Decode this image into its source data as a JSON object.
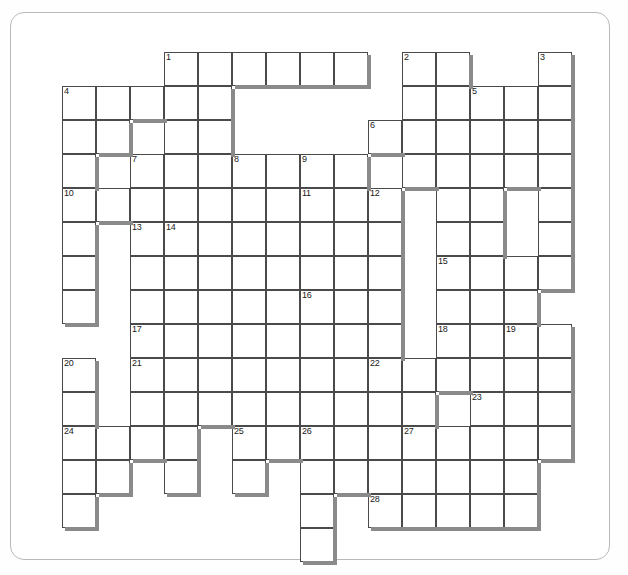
{
  "document": {
    "type": "crossword-puzzle-grid",
    "title": "Crossword Puzzle Grid",
    "sheet_background": "#ffffff",
    "cell_border_color": "#4a4a4a",
    "shadow_color": "#8a8a8a",
    "cell_size_px": 34,
    "grid_origin": {
      "x": 62,
      "y": 52
    },
    "grid_columns": 16,
    "grid_rows": 15
  },
  "grid": {
    "rows": [
      {
        "r": 0,
        "cells": [
          3,
          4,
          5,
          6,
          7,
          8,
          10,
          11,
          14
        ]
      },
      {
        "r": 1,
        "cells": [
          0,
          1,
          2,
          3,
          4,
          10,
          11,
          12,
          13,
          14
        ]
      },
      {
        "r": 2,
        "cells": [
          0,
          1,
          3,
          4,
          9,
          10,
          11,
          12,
          13,
          14
        ]
      },
      {
        "r": 3,
        "cells": [
          0,
          2,
          3,
          4,
          5,
          6,
          7,
          8,
          10,
          11,
          12,
          13,
          14
        ]
      },
      {
        "r": 4,
        "cells": [
          0,
          1,
          2,
          3,
          4,
          5,
          6,
          7,
          8,
          9,
          11,
          12,
          14
        ]
      },
      {
        "r": 5,
        "cells": [
          0,
          2,
          3,
          4,
          5,
          6,
          7,
          8,
          9,
          11,
          12,
          14
        ]
      },
      {
        "r": 6,
        "cells": [
          0,
          2,
          3,
          4,
          5,
          6,
          7,
          8,
          9,
          11,
          12,
          13,
          14
        ]
      },
      {
        "r": 7,
        "cells": [
          0,
          2,
          3,
          4,
          5,
          6,
          7,
          8,
          9,
          11,
          12,
          13
        ]
      },
      {
        "r": 8,
        "cells": [
          2,
          3,
          4,
          5,
          6,
          7,
          8,
          9,
          11,
          12,
          13,
          14
        ]
      },
      {
        "r": 9,
        "cells": [
          0,
          2,
          3,
          4,
          5,
          6,
          7,
          8,
          9,
          10,
          11,
          12,
          13,
          14
        ]
      },
      {
        "r": 10,
        "cells": [
          0,
          2,
          3,
          4,
          5,
          6,
          7,
          8,
          9,
          10,
          12,
          13,
          14
        ]
      },
      {
        "r": 11,
        "cells": [
          0,
          1,
          2,
          3,
          5,
          6,
          7,
          8,
          9,
          10,
          11,
          12,
          13,
          14
        ]
      },
      {
        "r": 12,
        "cells": [
          0,
          1,
          3,
          5,
          7,
          8,
          9,
          10,
          11,
          12,
          13
        ]
      },
      {
        "r": 13,
        "cells": [
          0,
          7,
          9,
          10,
          11,
          12,
          13
        ]
      },
      {
        "r": 14,
        "cells": [
          7
        ]
      }
    ]
  },
  "clue_numbers": [
    {
      "label": "1",
      "row": 0,
      "col": 3
    },
    {
      "label": "2",
      "row": 0,
      "col": 10
    },
    {
      "label": "3",
      "row": 0,
      "col": 14
    },
    {
      "label": "4",
      "row": 1,
      "col": 0
    },
    {
      "label": "5",
      "row": 1,
      "col": 12
    },
    {
      "label": "6",
      "row": 2,
      "col": 9
    },
    {
      "label": "7",
      "row": 3,
      "col": 2
    },
    {
      "label": "8",
      "row": 3,
      "col": 5
    },
    {
      "label": "9",
      "row": 3,
      "col": 7
    },
    {
      "label": "10",
      "row": 4,
      "col": 0
    },
    {
      "label": "11",
      "row": 4,
      "col": 7
    },
    {
      "label": "12",
      "row": 4,
      "col": 9
    },
    {
      "label": "13",
      "row": 5,
      "col": 2
    },
    {
      "label": "14",
      "row": 5,
      "col": 3
    },
    {
      "label": "15",
      "row": 6,
      "col": 11
    },
    {
      "label": "16",
      "row": 7,
      "col": 7
    },
    {
      "label": "17",
      "row": 8,
      "col": 2
    },
    {
      "label": "18",
      "row": 8,
      "col": 11
    },
    {
      "label": "19",
      "row": 8,
      "col": 13
    },
    {
      "label": "20",
      "row": 9,
      "col": 0
    },
    {
      "label": "21",
      "row": 9,
      "col": 2
    },
    {
      "label": "22",
      "row": 9,
      "col": 9
    },
    {
      "label": "23",
      "row": 10,
      "col": 12
    },
    {
      "label": "24",
      "row": 11,
      "col": 0
    },
    {
      "label": "25",
      "row": 11,
      "col": 5
    },
    {
      "label": "26",
      "row": 11,
      "col": 7
    },
    {
      "label": "27",
      "row": 11,
      "col": 10
    },
    {
      "label": "28",
      "row": 13,
      "col": 9
    }
  ],
  "entries": {
    "across_count": 0,
    "down_count": 0,
    "filled_letters": []
  }
}
